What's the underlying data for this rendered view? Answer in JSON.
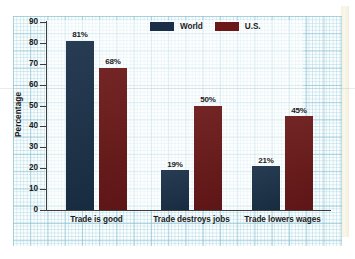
{
  "chart_data": {
    "type": "bar",
    "title": "",
    "subtitle": "",
    "xlabel": "",
    "ylabel": "Percentage",
    "ylim": [
      0,
      90
    ],
    "ytick_step": 10,
    "yticks": [
      "90",
      "80",
      "70",
      "60",
      "50",
      "40",
      "30",
      "20",
      "10",
      "0"
    ],
    "grid": true,
    "grid_style": "graph-paper",
    "legend_position": "top-center",
    "categories": [
      "Trade is good",
      "Trade destroys jobs",
      "Trade lowers wages"
    ],
    "series": [
      {
        "name": "World",
        "color": "#1a3048",
        "values": [
          81,
          19,
          21
        ],
        "labels": [
          "81%",
          "19%",
          "21%"
        ]
      },
      {
        "name": "U.S.",
        "color": "#6b1818",
        "values": [
          68,
          50,
          45
        ],
        "labels": [
          "68%",
          "50%",
          "45%"
        ]
      }
    ]
  },
  "legend": {
    "items": [
      {
        "label": "World",
        "color": "#1a3048"
      },
      {
        "label": "U.S.",
        "color": "#6b1818"
      }
    ]
  },
  "axes": {
    "y_title": "Percentage",
    "y_ticks": [
      "90",
      "80",
      "70",
      "60",
      "50",
      "40",
      "30",
      "20",
      "10",
      "0"
    ]
  },
  "colors": {
    "world": "#1a3048",
    "us": "#6b1818",
    "grid": "#96c8d7",
    "paper": "#fbfeff",
    "axis": "#3c3c3c",
    "page_bleed": "#f4f0dc"
  }
}
